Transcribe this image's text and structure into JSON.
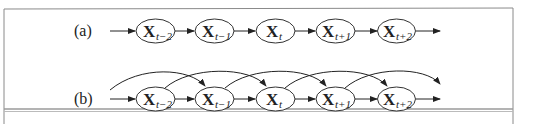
{
  "figure": {
    "rows": [
      {
        "label": "(a)",
        "description": "first-order Markov chain",
        "nodes": [
          {
            "var": "X",
            "sub": "t−2"
          },
          {
            "var": "X",
            "sub": "t−1"
          },
          {
            "var": "X",
            "sub": "t"
          },
          {
            "var": "X",
            "sub": "t+1"
          },
          {
            "var": "X",
            "sub": "t+2"
          }
        ],
        "edges": "consecutive"
      },
      {
        "label": "(b)",
        "description": "second-order Markov chain",
        "nodes": [
          {
            "var": "X",
            "sub": "t−2"
          },
          {
            "var": "X",
            "sub": "t−1"
          },
          {
            "var": "X",
            "sub": "t"
          },
          {
            "var": "X",
            "sub": "t+1"
          },
          {
            "var": "X",
            "sub": "t+2"
          }
        ],
        "edges": "consecutive and skip-one arcs"
      }
    ],
    "colors": {
      "stroke": "#333333",
      "frame": "#888888",
      "background": "#ffffff"
    }
  }
}
